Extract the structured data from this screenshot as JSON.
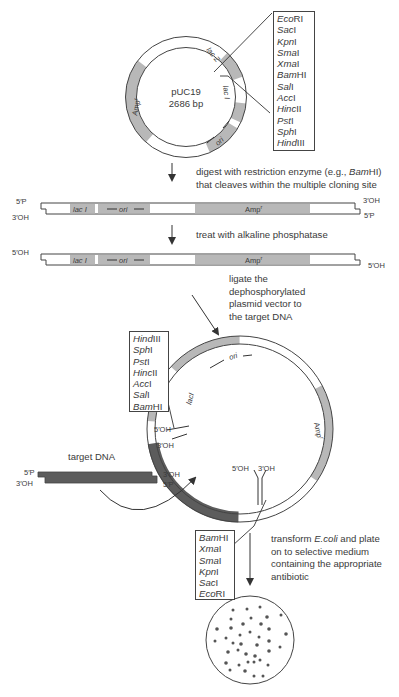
{
  "plasmid": {
    "name": "pUC19",
    "size": "2686 bp",
    "features": {
      "lacZ": "lac Z",
      "lacI": "lac I",
      "ori": "ori",
      "amp": "Amp",
      "amp_sup": "r"
    }
  },
  "mcs_box_top": [
    {
      "it": "Eco",
      "rest": "RI"
    },
    {
      "it": "Sac",
      "rest": "I"
    },
    {
      "it": "Kpn",
      "rest": "I"
    },
    {
      "it": "Sma",
      "rest": "I"
    },
    {
      "it": "Xma",
      "rest": "I"
    },
    {
      "it": "Bam",
      "rest": "HI"
    },
    {
      "it": "Sal",
      "rest": "I"
    },
    {
      "it": "Acc",
      "rest": "I"
    },
    {
      "it": "Hinc",
      "rest": "II"
    },
    {
      "it": "Pst",
      "rest": "I"
    },
    {
      "it": "Sph",
      "rest": "I"
    },
    {
      "it": "Hind",
      "rest": "III"
    }
  ],
  "mcs_box_left": [
    {
      "it": "Hind",
      "rest": "III"
    },
    {
      "it": "Sph",
      "rest": "I"
    },
    {
      "it": "Pst",
      "rest": "I"
    },
    {
      "it": "Hinc",
      "rest": "II"
    },
    {
      "it": "Acc",
      "rest": "I"
    },
    {
      "it": "Sal",
      "rest": "I"
    },
    {
      "it": "Bam",
      "rest": "HI"
    }
  ],
  "mcs_box_bottom": [
    {
      "it": "Bam",
      "rest": "HI"
    },
    {
      "it": "Xma",
      "rest": "I"
    },
    {
      "it": "Sma",
      "rest": "I"
    },
    {
      "it": "Kpn",
      "rest": "I"
    },
    {
      "it": "Sac",
      "rest": "I"
    },
    {
      "it": "Eco",
      "rest": "RI"
    }
  ],
  "steps": {
    "digest_line1_pre": "digest with restriction enzyme (e.g., ",
    "digest_line1_it": "Bam",
    "digest_line1_post": "HI)",
    "digest_line2": "that cleaves within the multiple cloning site",
    "phosphatase": "treat with alkaline phosphatase",
    "ligate": [
      "ligate the",
      "dephosphorylated",
      "plasmid vector to",
      "the target DNA"
    ],
    "transform_line1_pre": "transform ",
    "transform_line1_it": "E.coli",
    "transform_line1_post": " and plate",
    "transform_rest": [
      "on to selective medium",
      "containing the appropriate",
      "antibiotic"
    ]
  },
  "ends": {
    "p5": "5′P",
    "oh3": "3′OH",
    "oh5": "5′OH"
  },
  "target_dna_label": "target DNA",
  "colors": {
    "feature_gray": "#b5b5b5",
    "insert_dark": "#5c5c5c",
    "outline": "#444444"
  }
}
